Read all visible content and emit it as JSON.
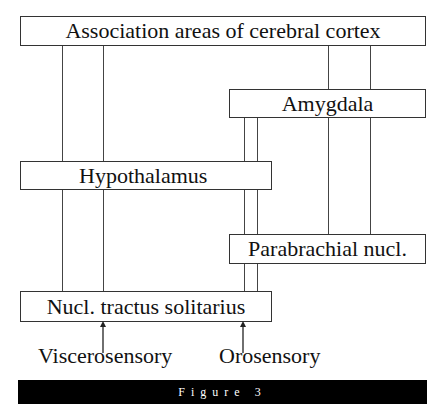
{
  "diagram": {
    "nodes": {
      "association": "Association areas of cerebral cortex",
      "amygdala": "Amygdala",
      "hypothalamus": "Hypothalamus",
      "parabrachial": "Parabrachial nucl.",
      "nts": "Nucl. tractus solitarius"
    },
    "inputs": {
      "viscerosensory": "Viscerosensory",
      "orosensory": "Orosensory"
    },
    "edges": [
      {
        "from": "association",
        "to": "hypothalamus"
      },
      {
        "from": "association",
        "to": "nts"
      },
      {
        "from": "association",
        "to": "amygdala"
      },
      {
        "from": "amygdala",
        "to": "parabrachial"
      },
      {
        "from": "amygdala",
        "to": "nts"
      },
      {
        "from": "hypothalamus",
        "to": "nts"
      },
      {
        "from": "parabrachial",
        "to": "nts"
      },
      {
        "from": "viscerosensory",
        "to": "nts",
        "arrow": true
      },
      {
        "from": "orosensory",
        "to": "nts",
        "arrow": true
      }
    ],
    "caption": "Figure 3"
  }
}
